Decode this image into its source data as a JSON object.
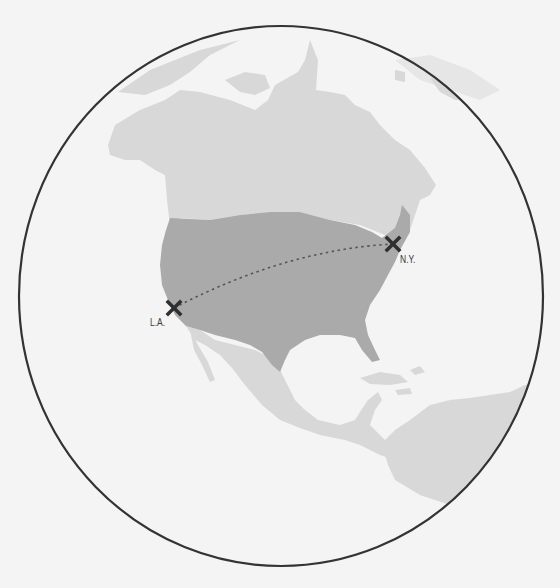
{
  "map": {
    "colors": {
      "background": "#f4f4f4",
      "ocean": "#f4f4f4",
      "land": "#d8d8d8",
      "highlight_country": "#aaaaaa",
      "globe_outline": "#333333",
      "route": "#555555",
      "marker": "#2f2f2f"
    },
    "highlighted_region": "United States",
    "cities": [
      {
        "label": "L.A.",
        "x": 174,
        "y": 308,
        "icon": "x-marker-icon"
      },
      {
        "label": "N.Y.",
        "x": 393,
        "y": 244,
        "icon": "x-marker-icon"
      }
    ],
    "route": {
      "from": "L.A.",
      "to": "N.Y.",
      "style": "dotted"
    }
  }
}
